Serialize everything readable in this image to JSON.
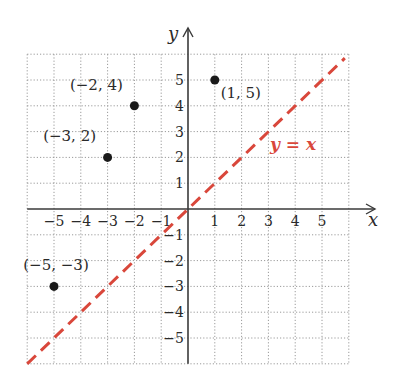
{
  "chart_data": {
    "type": "scatter",
    "title": "",
    "xlabel": "x",
    "ylabel": "y",
    "xlim": [
      -6,
      6
    ],
    "ylim": [
      -6,
      6
    ],
    "grid": true,
    "grid_style": "dotted",
    "xticks": [
      -5,
      -4,
      -3,
      -2,
      -1,
      1,
      2,
      3,
      4,
      5
    ],
    "yticks": [
      -5,
      -4,
      -3,
      -2,
      -1,
      1,
      2,
      3,
      4,
      5
    ],
    "xtick_labels": [
      "−5",
      "−4",
      "−3",
      "−2",
      "−1",
      "1",
      "2",
      "3",
      "4",
      "5"
    ],
    "ytick_labels": [
      "−5",
      "−4",
      "−3",
      "−2",
      "−1",
      "1",
      "2",
      "3",
      "4",
      "5"
    ],
    "points": [
      {
        "x": -2,
        "y": 4,
        "label": "(−2, 4)"
      },
      {
        "x": -3,
        "y": 2,
        "label": "(−3, 2)"
      },
      {
        "x": 1,
        "y": 5,
        "label": "(1, 5)"
      },
      {
        "x": -5,
        "y": -3,
        "label": "(−5, −3)"
      }
    ],
    "lines": [
      {
        "equation": "y = x",
        "label": "y = x",
        "style": "dashed",
        "color": "#d9473b",
        "x_range": [
          -6,
          6
        ]
      }
    ],
    "annotations": [
      {
        "text": "y = x",
        "x": 3.2,
        "y": 2.5,
        "color": "#d9473b"
      }
    ]
  },
  "colors": {
    "axis": "#3a3a3a",
    "grid": "#9a9a9a",
    "point": "#1a1a1a",
    "line": "#d9473b"
  }
}
